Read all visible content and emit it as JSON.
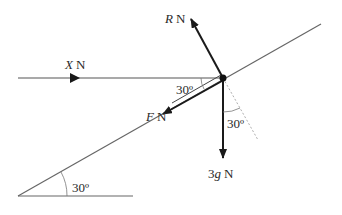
{
  "diagram": {
    "type": "forces-on-inclined-plane",
    "forces": {
      "horizontal": {
        "symbol": "X",
        "unit": "N"
      },
      "reaction": {
        "symbol": "R",
        "unit": "N"
      },
      "friction": {
        "symbol": "F",
        "unit": "N"
      },
      "weight": {
        "coef": "3",
        "symbol": "g",
        "unit": "N"
      }
    },
    "angles": {
      "incline": "30º",
      "friction_to_horizontal": "30º",
      "weight_to_normal": "30º"
    },
    "colors": {
      "line": "#555555",
      "arrow": "#1a1a1a",
      "dashed": "#999999"
    }
  }
}
